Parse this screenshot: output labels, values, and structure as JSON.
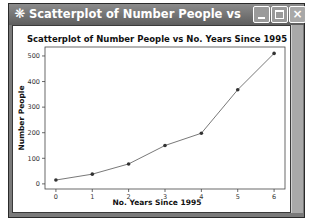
{
  "window": {
    "title": "Scatterplot of Number People vs No. Years Since ...",
    "icon": "minitab-graph-icon",
    "controls": {
      "minimize": "minimize-icon",
      "maximize": "maximize-icon",
      "close": "×"
    }
  },
  "chart_data": {
    "type": "line",
    "title": "Scatterplot of Number People vs No. Years Since 1995",
    "xlabel": "No. Years Since 1995",
    "ylabel": "Number People",
    "x": [
      0,
      1,
      2,
      3,
      4,
      5,
      6
    ],
    "series": [
      {
        "name": "Number People",
        "values": [
          15,
          38,
          78,
          150,
          198,
          368,
          510
        ],
        "marker": "circle",
        "connected": true
      }
    ],
    "xticks": [
      "0",
      "1",
      "2",
      "3",
      "4",
      "5",
      "6"
    ],
    "yticks": [
      "0",
      "100",
      "200",
      "300",
      "400",
      "500"
    ],
    "xlim": [
      -0.3,
      6.3
    ],
    "ylim": [
      -20,
      535
    ],
    "grid": false,
    "legend": "none",
    "colors": {
      "line": "#555555",
      "marker": "#333333"
    }
  }
}
